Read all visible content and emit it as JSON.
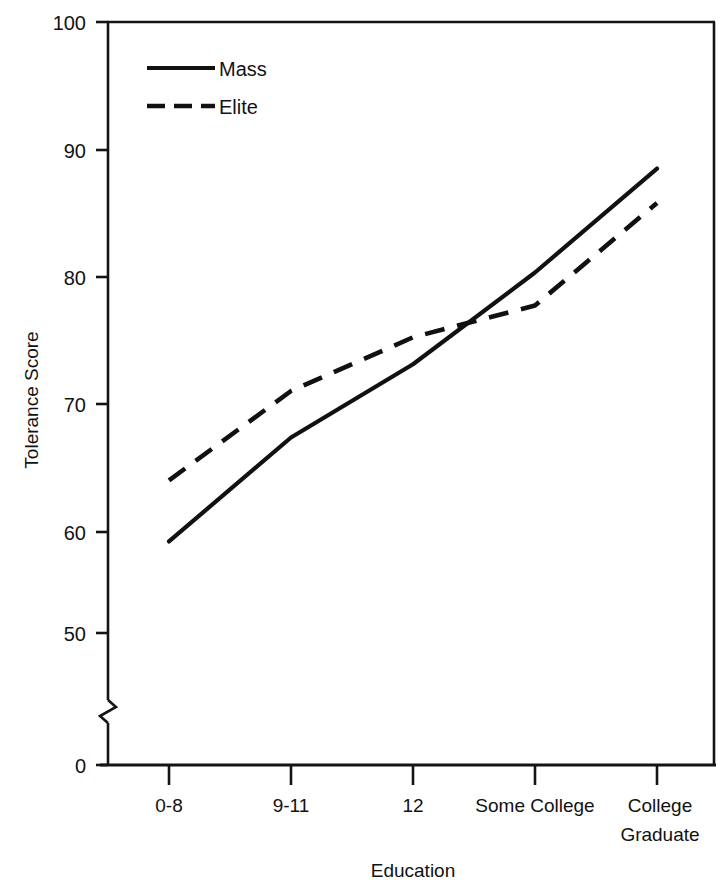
{
  "chart_data": {
    "type": "line",
    "title": "",
    "xlabel": "Education",
    "ylabel": "Tolerance Score",
    "categories": [
      "0-8",
      "9-11",
      "12",
      "Some College",
      "College Graduate"
    ],
    "ylim": [
      0,
      100
    ],
    "yticks": [
      0,
      50,
      60,
      70,
      80,
      90,
      100
    ],
    "ytick_labels": [
      "0",
      "50",
      "60",
      "70",
      "80",
      "90",
      "100"
    ],
    "y_axis_break": true,
    "y_axis_break_between": [
      0,
      50
    ],
    "grid": false,
    "legend_position": "top-left",
    "series": [
      {
        "name": "Mass",
        "style": "solid",
        "color": "#111111",
        "values": [
          57.5,
          66.0,
          72.0,
          79.5,
          88.0
        ]
      },
      {
        "name": "Elite",
        "style": "dashed",
        "color": "#111111",
        "values": [
          62.5,
          69.8,
          74.2,
          76.8,
          85.2
        ]
      }
    ],
    "annotations": [
      "Mass and Elite lines cross between '12' and 'Some College'"
    ]
  },
  "axis": {
    "y_title": "Tolerance Score",
    "x_title": "Education",
    "ticks_y": [
      "100",
      "90",
      "80",
      "70",
      "60",
      "50",
      "0"
    ],
    "ticks_x": [
      "0-8",
      "9-11",
      "12",
      "Some College",
      "College",
      "Graduate"
    ]
  },
  "legend": {
    "items": [
      {
        "label": "Mass",
        "style": "solid"
      },
      {
        "label": "Elite",
        "style": "dashed"
      }
    ]
  },
  "xtick_labels": {
    "t0": "0-8",
    "t1": "9-11",
    "t2": "12",
    "t3": "Some College",
    "t4_line1": "College",
    "t4_line2": "Graduate"
  },
  "ytick_labels": {
    "y100": "100",
    "y90": "90",
    "y80": "80",
    "y70": "70",
    "y60": "60",
    "y50": "50",
    "y0": "0"
  }
}
